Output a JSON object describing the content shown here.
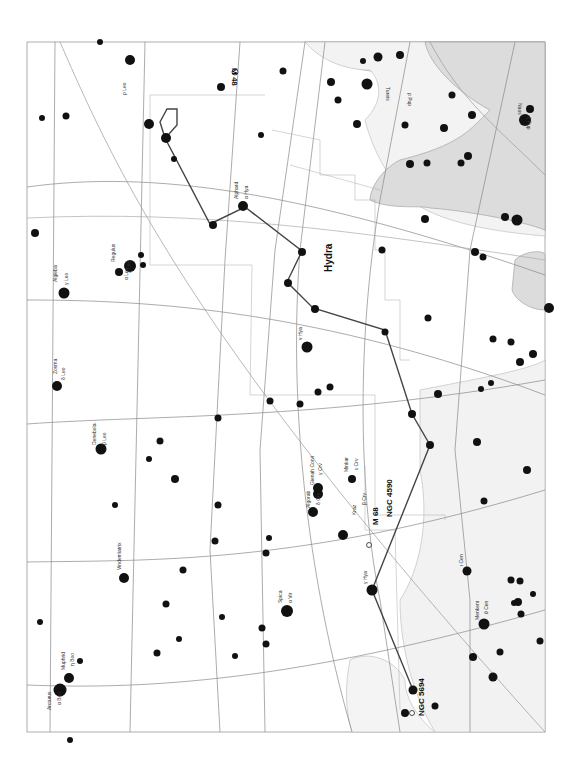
{
  "map": {
    "type": "star-chart",
    "orientation": "rotated-90",
    "frame": {
      "x": 27,
      "y": 42,
      "width": 518,
      "height": 690
    },
    "colors": {
      "background": "#ffffff",
      "milky_way_fill": "#dcdcdc",
      "light_region_fill": "#f0f0f0",
      "grid_line": "#888888",
      "constellation_line": "#444444",
      "boundary_line": "#aaaaaa",
      "star": "#111111"
    },
    "labels": {
      "constellation": "Hydra",
      "m48": "M 48",
      "m68": "M 68",
      "ngc4590": "NGC 4590",
      "ngc5694": "NGC 5694",
      "alphard": "Alphard",
      "alphard_sub": "α Hya",
      "zosma": "Zosma",
      "zosma_sub": "δ Leo",
      "algieba": "Algieba",
      "algieba_sub": "γ Leo",
      "regulus": "Regulus",
      "regulus_sub": "α Leo",
      "denebola": "Denebola",
      "denebola_sub": "β Leo",
      "gienah": "Gienah Corvi",
      "gienah_sub": "γ Crv",
      "algorab": "Algorab",
      "algorab_sub": "δ Crv",
      "minkar": "Minkar",
      "minkar_sub": "ε Crv",
      "kraz": "Kraz",
      "kraz_sub": "β Crv",
      "vindemiatrix": "Vindemiatrix",
      "vindemiatrix_sub": "ε Vir",
      "spica": "Spica",
      "spica_sub": "α Vir",
      "muphrid": "Muphrid",
      "muphrid_sub": "η Boo",
      "arcturus": "Arcturus",
      "arcturus_sub": "α Boo",
      "menkent": "Menkent",
      "menkent_sub": "θ Cen",
      "iota_cen": "ι Cen",
      "gamma_hya": "γ Hya",
      "nu_hya": "ν Hya",
      "lambda_hya": "λ Hya",
      "rho_leo": "ρ Leo",
      "chi_leo": "χ Leo",
      "pi_hya": "π Hya",
      "xi_hya": "ξ Hya",
      "rho_pup": "ρ Pup",
      "tureis": "Tureis",
      "zeta_pup": "ζ Pup",
      "naos": "Naos"
    }
  }
}
